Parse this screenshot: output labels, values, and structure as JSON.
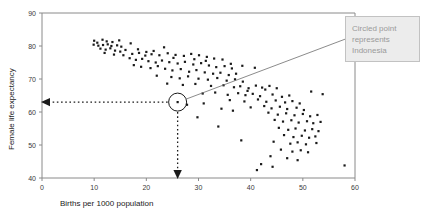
{
  "chart_data": {
    "type": "scatter",
    "title": "",
    "xlabel": "Births per 1000 population",
    "ylabel": "Female life expectancy",
    "xlim": [
      0,
      60
    ],
    "ylim": [
      40,
      90
    ],
    "xticks": [
      0,
      10,
      20,
      30,
      40,
      50,
      60
    ],
    "yticks": [
      40,
      50,
      60,
      70,
      80,
      90
    ],
    "grid": false,
    "legend": null,
    "annotations": [
      {
        "name": "callout",
        "text": "Circled point represents Indonesia",
        "lines": [
          "Circled point",
          "represents",
          "Indonesia"
        ],
        "points_to": {
          "x": 26.0,
          "y": 63.0
        }
      },
      {
        "name": "highlight-circle",
        "x": 26.0,
        "y": 63.0,
        "label": "Indonesia"
      },
      {
        "name": "y-guide-arrow",
        "from": {
          "x": 26.0,
          "y": 63.0
        },
        "to": {
          "x": 0,
          "y": 63.0
        }
      },
      {
        "name": "x-guide-arrow",
        "from": {
          "x": 26.0,
          "y": 63.0
        },
        "to": {
          "x": 26.0,
          "y": 40
        }
      }
    ],
    "points": [
      [
        10.0,
        81.6
      ],
      [
        10.6,
        81.0
      ],
      [
        11.6,
        81.9
      ],
      [
        12.4,
        81.4
      ],
      [
        13.5,
        81.2
      ],
      [
        9.9,
        80.4
      ],
      [
        10.8,
        80.1
      ],
      [
        11.7,
        80.3
      ],
      [
        12.6,
        80.5
      ],
      [
        13.3,
        80.0
      ],
      [
        14.4,
        80.2
      ],
      [
        15.2,
        79.8
      ],
      [
        11.2,
        79.2
      ],
      [
        12.2,
        78.9
      ],
      [
        13.1,
        79.3
      ],
      [
        14.0,
        78.6
      ],
      [
        15.0,
        78.3
      ],
      [
        16.0,
        78.8
      ],
      [
        12.0,
        77.9
      ],
      [
        13.8,
        77.4
      ],
      [
        15.6,
        77.2
      ],
      [
        17.3,
        77.6
      ],
      [
        18.6,
        77.9
      ],
      [
        19.8,
        77.1
      ],
      [
        21.0,
        77.5
      ],
      [
        22.5,
        77.2
      ],
      [
        24.1,
        77.8
      ],
      [
        25.6,
        77.3
      ],
      [
        27.2,
        77.0
      ],
      [
        28.6,
        77.6
      ],
      [
        30.1,
        77.2
      ],
      [
        31.6,
        76.7
      ],
      [
        33.0,
        76.2
      ],
      [
        34.6,
        75.9
      ],
      [
        16.8,
        76.3
      ],
      [
        18.0,
        75.8
      ],
      [
        19.2,
        76.1
      ],
      [
        20.4,
        75.4
      ],
      [
        21.8,
        75.0
      ],
      [
        23.0,
        75.6
      ],
      [
        24.4,
        75.1
      ],
      [
        26.0,
        74.7
      ],
      [
        27.4,
        75.2
      ],
      [
        29.0,
        74.4
      ],
      [
        30.5,
        74.8
      ],
      [
        32.0,
        74.1
      ],
      [
        33.4,
        73.6
      ],
      [
        35.0,
        73.9
      ],
      [
        36.4,
        73.2
      ],
      [
        17.6,
        74.2
      ],
      [
        19.0,
        73.7
      ],
      [
        20.8,
        73.3
      ],
      [
        22.2,
        73.9
      ],
      [
        23.6,
        73.1
      ],
      [
        25.0,
        72.6
      ],
      [
        26.6,
        73.0
      ],
      [
        28.2,
        72.2
      ],
      [
        29.6,
        72.7
      ],
      [
        31.2,
        72.0
      ],
      [
        32.8,
        71.6
      ],
      [
        34.2,
        71.9
      ],
      [
        35.8,
        71.2
      ],
      [
        37.2,
        71.6
      ],
      [
        22.0,
        71.0
      ],
      [
        24.8,
        70.6
      ],
      [
        26.4,
        70.2
      ],
      [
        28.0,
        70.8
      ],
      [
        30.0,
        70.1
      ],
      [
        31.8,
        69.8
      ],
      [
        33.6,
        70.3
      ],
      [
        35.4,
        69.5
      ],
      [
        37.0,
        69.9
      ],
      [
        38.5,
        69.2
      ],
      [
        24.0,
        68.6
      ],
      [
        27.0,
        68.2
      ],
      [
        29.4,
        68.5
      ],
      [
        32.4,
        67.9
      ],
      [
        34.8,
        68.1
      ],
      [
        36.8,
        67.5
      ],
      [
        38.0,
        67.8
      ],
      [
        39.6,
        67.2
      ],
      [
        41.0,
        68.0
      ],
      [
        42.2,
        67.4
      ],
      [
        43.6,
        67.9
      ],
      [
        45.0,
        67.2
      ],
      [
        26.0,
        63.0
      ],
      [
        30.8,
        65.6
      ],
      [
        33.2,
        65.9
      ],
      [
        35.6,
        65.2
      ],
      [
        37.6,
        65.7
      ],
      [
        39.0,
        65.1
      ],
      [
        40.4,
        65.5
      ],
      [
        41.8,
        64.8
      ],
      [
        44.2,
        65.3
      ],
      [
        46.0,
        64.6
      ],
      [
        47.4,
        65.0
      ],
      [
        36.0,
        63.6
      ],
      [
        38.8,
        63.2
      ],
      [
        41.4,
        63.8
      ],
      [
        43.0,
        63.1
      ],
      [
        44.8,
        63.5
      ],
      [
        46.6,
        62.9
      ],
      [
        48.0,
        63.3
      ],
      [
        49.4,
        62.6
      ],
      [
        40.0,
        61.4
      ],
      [
        42.6,
        61.8
      ],
      [
        44.0,
        61.1
      ],
      [
        45.6,
        61.6
      ],
      [
        47.0,
        60.9
      ],
      [
        48.8,
        61.3
      ],
      [
        50.2,
        60.6
      ],
      [
        43.4,
        59.8
      ],
      [
        45.2,
        59.2
      ],
      [
        46.8,
        59.6
      ],
      [
        48.4,
        59.0
      ],
      [
        50.0,
        59.4
      ],
      [
        51.4,
        58.7
      ],
      [
        52.8,
        59.1
      ],
      [
        29.8,
        58.4
      ],
      [
        44.6,
        57.6
      ],
      [
        46.2,
        57.1
      ],
      [
        47.8,
        57.5
      ],
      [
        49.2,
        56.8
      ],
      [
        50.8,
        57.2
      ],
      [
        52.0,
        56.6
      ],
      [
        53.4,
        57.0
      ],
      [
        33.8,
        55.6
      ],
      [
        45.4,
        55.2
      ],
      [
        47.2,
        54.6
      ],
      [
        48.6,
        55.0
      ],
      [
        50.4,
        54.4
      ],
      [
        51.8,
        54.8
      ],
      [
        53.0,
        54.2
      ],
      [
        46.4,
        53.0
      ],
      [
        48.2,
        52.4
      ],
      [
        49.8,
        52.8
      ],
      [
        51.2,
        52.2
      ],
      [
        52.4,
        52.6
      ],
      [
        38.2,
        51.4
      ],
      [
        44.4,
        51.0
      ],
      [
        47.6,
        50.4
      ],
      [
        49.0,
        50.8
      ],
      [
        50.6,
        50.2
      ],
      [
        52.6,
        50.6
      ],
      [
        45.8,
        48.6
      ],
      [
        48.0,
        48.0
      ],
      [
        49.6,
        48.4
      ],
      [
        51.0,
        47.8
      ],
      [
        43.8,
        46.6
      ],
      [
        47.0,
        46.0
      ],
      [
        49.0,
        45.4
      ],
      [
        42.0,
        44.2
      ],
      [
        44.2,
        43.4
      ],
      [
        58.0,
        43.8
      ],
      [
        41.2,
        42.4
      ],
      [
        27.8,
        62.2
      ],
      [
        31.0,
        62.6
      ],
      [
        34.4,
        61.0
      ],
      [
        36.6,
        60.4
      ],
      [
        39.4,
        66.4
      ],
      [
        42.8,
        66.8
      ],
      [
        51.6,
        66.2
      ],
      [
        53.8,
        65.4
      ],
      [
        23.4,
        79.6
      ],
      [
        20.0,
        78.2
      ],
      [
        17.0,
        80.8
      ],
      [
        14.8,
        81.7
      ],
      [
        18.4,
        79.0
      ],
      [
        21.4,
        78.5
      ],
      [
        25.2,
        76.4
      ],
      [
        29.2,
        76.0
      ],
      [
        31.4,
        75.5
      ],
      [
        36.2,
        74.6
      ],
      [
        38.4,
        74.0
      ],
      [
        40.8,
        73.4
      ]
    ]
  }
}
